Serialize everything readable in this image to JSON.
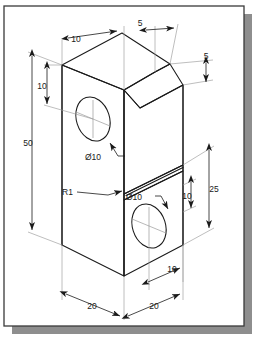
{
  "drawing": {
    "title": "Isometric part drawing",
    "type": "engineering-isometric",
    "sheet": {
      "background_color": "#ffffff",
      "border_color": "#3a3a3a",
      "shadow_color": "#8e8e8e",
      "line_color": "#1a1a1a"
    },
    "dimensions": [
      {
        "id": "top-depth-10",
        "label": "10",
        "name": "top-depth-dimension"
      },
      {
        "id": "chamfer-top-5",
        "label": "5",
        "name": "chamfer-horizontal-dimension"
      },
      {
        "id": "chamfer-side-5",
        "label": "5",
        "name": "chamfer-vertical-dimension"
      },
      {
        "id": "upper-hole-10",
        "label": "10",
        "name": "upper-hole-height-dimension"
      },
      {
        "id": "overall-height-50",
        "label": "50",
        "name": "overall-height-dimension"
      },
      {
        "id": "upper-hole-dia",
        "label": "Ø10",
        "name": "upper-hole-diameter-callout"
      },
      {
        "id": "fillet-r1",
        "label": "R1",
        "name": "fillet-radius-callout"
      },
      {
        "id": "lower-hole-dia",
        "label": "Ø10",
        "name": "lower-hole-diameter-callout"
      },
      {
        "id": "lower-block-25",
        "label": "25",
        "name": "lower-block-height-dimension"
      },
      {
        "id": "lower-hole-10",
        "label": "10",
        "name": "lower-hole-height-dimension"
      },
      {
        "id": "lower-hole-pos-10",
        "label": "10",
        "name": "lower-hole-position-dimension"
      },
      {
        "id": "width-left-20",
        "label": "20",
        "name": "left-width-dimension"
      },
      {
        "id": "width-right-20",
        "label": "20",
        "name": "right-width-dimension"
      }
    ]
  }
}
